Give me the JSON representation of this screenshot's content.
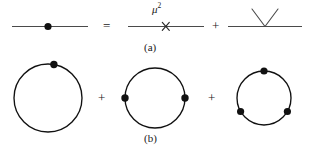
{
  "figure": {
    "background_color": "#ffffff",
    "stroke_color": "#1a1a1a",
    "width": 310,
    "height": 154,
    "rows": [
      {
        "id": "row-a",
        "caption": "(a)",
        "terms": [
          {
            "kind": "propagator-line-with-vertex-dot",
            "name": "full-propagator",
            "label": "",
            "dots": 1
          },
          {
            "kind": "propagator-line-with-cross",
            "name": "mass-insertion",
            "label": "μ",
            "exponent": "2",
            "cross_glyph": "×",
            "dots": 0
          },
          {
            "kind": "propagator-line-with-vee",
            "name": "vertex-correction",
            "label": "",
            "dots": 0
          }
        ],
        "operators": [
          "=",
          "+"
        ]
      },
      {
        "id": "row-b",
        "caption": "(b)",
        "terms": [
          {
            "kind": "loop-circle",
            "name": "one-vertex-loop",
            "dots": 1,
            "dot_angles_deg": [
              80
            ]
          },
          {
            "kind": "loop-circle",
            "name": "two-vertex-loop",
            "dots": 2,
            "dot_angles_deg": [
              180,
              0
            ]
          },
          {
            "kind": "loop-circle",
            "name": "three-vertex-loop",
            "dots": 3,
            "dot_angles_deg": [
              90,
              210,
              330
            ]
          }
        ],
        "operators": [
          "+",
          "+"
        ]
      }
    ],
    "operator_equals": "=",
    "operator_plus": "+",
    "mu_symbol": "μ",
    "mu_exponent": "2",
    "cross_symbol": "×",
    "caption_a": "(a)",
    "caption_b": "(b)"
  }
}
